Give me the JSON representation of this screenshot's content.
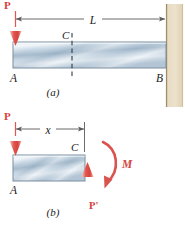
{
  "figure": {
    "colors": {
      "force_red": "#e2564f",
      "force_red_light": "#f3b9b6",
      "moment_red": "#d9544e",
      "beam_light": "#eef4f8",
      "beam_mid": "#b8cbdb",
      "beam_dark": "#93a9bd",
      "beam_edge": "#6f8196",
      "wall_fill": "#e4d6bb",
      "wall_edge": "#b9a685",
      "dim_line": "#5a5a5a",
      "text": "#1a1a1a",
      "dash": "#2f3a48"
    },
    "panels": [
      {
        "id": "panel-a",
        "caption": "(a)",
        "labels": {
          "load": "P",
          "length": "L",
          "point_a": "A",
          "point_b": "B",
          "point_c": "C"
        }
      },
      {
        "id": "panel-b",
        "caption": "(b)",
        "labels": {
          "load": "P",
          "distance": "x",
          "point_a": "A",
          "point_c": "C",
          "reaction": "P'",
          "moment": "M"
        }
      }
    ]
  }
}
